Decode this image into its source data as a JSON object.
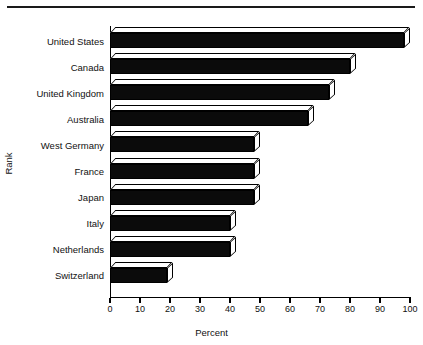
{
  "chart_data": {
    "type": "bar",
    "orientation": "horizontal",
    "title": "",
    "xlabel": "Percent",
    "ylabel": "Rank",
    "xlim": [
      0,
      100
    ],
    "xticks": [
      0,
      10,
      20,
      30,
      40,
      50,
      60,
      70,
      80,
      90,
      100
    ],
    "grid": false,
    "legend": null,
    "style": "3d-bars-black-fill",
    "categories": [
      "United States",
      "Canada",
      "United Kingdom",
      "Australia",
      "West Germany",
      "France",
      "Japan",
      "Italy",
      "Netherlands",
      "Switzerland"
    ],
    "values": [
      98,
      80,
      73,
      66,
      48,
      48,
      48,
      40,
      40,
      19
    ]
  },
  "colors": {
    "bar_front": "#0b0b0b",
    "bar_top": "#ffffff",
    "axis": "#000000",
    "text": "#111111",
    "background": "#ffffff",
    "rule": "#1a1a1a"
  }
}
